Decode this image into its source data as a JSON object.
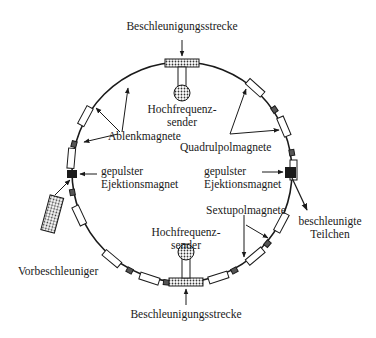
{
  "labels": {
    "top_accel": "Beschleunigungsstrecke",
    "bottom_accel": "Beschleunigungsstrecke",
    "rf_top_1": "Hochfrequenz-",
    "rf_top_2": "sender",
    "rf_bottom_1": "Hochfrequenz-",
    "rf_bottom_2": "sender",
    "dipoles": "Ablenkmagnete",
    "quadrupoles": "Quadrulpolmagnete",
    "sextupoles": "Sextupolmagnete",
    "inj_1": "gepulster",
    "inj_2": "Ejektionsmagnet",
    "ext_1": "gepulster",
    "ext_2": "Ejektionsmagnet",
    "preaccel": "Vorbeschleuniger",
    "beam_1": "beschleunigte",
    "beam_2": "Teilchen"
  },
  "colors": {
    "ink": "#1a1a1a",
    "paper": "#ffffff"
  }
}
